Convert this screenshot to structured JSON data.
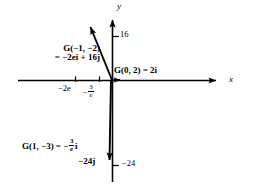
{
  "figure": {
    "type": "vector-diagram",
    "axes": {
      "x_label": "x",
      "y_label": "y",
      "origin_px": [
        112,
        80
      ],
      "x_axis_range_px": [
        18,
        222
      ],
      "y_axis_range_px": [
        14,
        182
      ]
    },
    "tick_labels": [
      {
        "text": "16",
        "axis": "y",
        "value": 16,
        "position_px": [
          122,
          33
        ]
      },
      {
        "text": "−24",
        "axis": "y",
        "value": -24,
        "position_px": [
          126,
          163
        ]
      },
      {
        "text": "−2e",
        "axis": "x",
        "value": -5.44,
        "position_px": [
          60,
          88
        ]
      },
      {
        "text": "−3/e",
        "axis": "x",
        "value": -1.1,
        "position_px": [
          88,
          86
        ]
      }
    ],
    "tick_fraction": {
      "minus": "−",
      "numerator": "3",
      "denominator": "e"
    },
    "vectors": [
      {
        "name": "G(-1,-2)",
        "label_line1": "G(−1, −2)",
        "label_line2": "= −2ei + 16j",
        "from_px": [
          112,
          80
        ],
        "to_px": [
          88,
          24
        ],
        "components": {
          "i": "−2e",
          "j": "16"
        }
      },
      {
        "name": "G(0,2)",
        "label": "G(0, 2) = 2i",
        "from_px": [
          112,
          80
        ],
        "to_px": [
          126,
          80
        ],
        "components": {
          "i": "2",
          "j": "0"
        }
      },
      {
        "name": "G(1,-3)",
        "label_prefix": "G(1, −3) = −",
        "label_suffix": "i",
        "from_px": [
          112,
          80
        ],
        "to_px": [
          110,
          166
        ],
        "components": {
          "i": "−3/e",
          "j": "0"
        }
      }
    ],
    "vector_end_labels": [
      {
        "text": "−24j",
        "position_px": [
          80,
          158
        ]
      }
    ],
    "colors": {
      "stroke": "#000000",
      "background": "#ffffff"
    }
  }
}
